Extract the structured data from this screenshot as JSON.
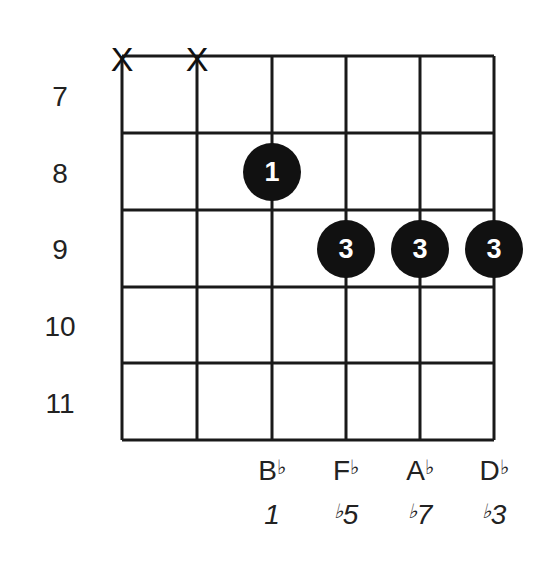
{
  "diagram": {
    "type": "guitar-chord-diagram",
    "strings": 6,
    "start_fret": 7,
    "fret_labels": [
      "7",
      "8",
      "9",
      "10",
      "11"
    ],
    "muted_strings": [
      1,
      2
    ],
    "mute_symbol": "X",
    "fingers": [
      {
        "string": 3,
        "fret": 8,
        "finger": "1"
      },
      {
        "string": 4,
        "fret": 9,
        "finger": "3"
      },
      {
        "string": 5,
        "fret": 9,
        "finger": "3"
      },
      {
        "string": 6,
        "fret": 9,
        "finger": "3"
      }
    ],
    "notes": [
      {
        "string": 3,
        "letter": "B",
        "accidental": "♭"
      },
      {
        "string": 4,
        "letter": "F",
        "accidental": "♭"
      },
      {
        "string": 5,
        "letter": "A",
        "accidental": "♭"
      },
      {
        "string": 6,
        "letter": "D",
        "accidental": "♭"
      }
    ],
    "intervals": [
      {
        "string": 3,
        "accidental": "",
        "degree": "1"
      },
      {
        "string": 4,
        "accidental": "♭",
        "degree": "5"
      },
      {
        "string": 5,
        "accidental": "♭",
        "degree": "7"
      },
      {
        "string": 6,
        "accidental": "♭",
        "degree": "3"
      }
    ],
    "colors": {
      "line": "#1a1a1a",
      "dot": "#111111",
      "dot_text": "#ffffff",
      "background": "#ffffff"
    }
  }
}
